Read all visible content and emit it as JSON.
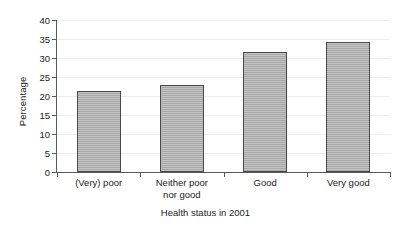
{
  "chart_data": {
    "type": "bar",
    "title": "",
    "xlabel": "Health status in 2001",
    "ylabel": "Percentage",
    "categories": [
      "(Very) poor",
      "Neither poor nor good",
      "Good",
      "Very good"
    ],
    "category_lines": [
      [
        "(Very) poor"
      ],
      [
        "Neither poor",
        "nor good"
      ],
      [
        "Good"
      ],
      [
        "Very good"
      ]
    ],
    "values": [
      21.4,
      22.8,
      31.7,
      34.2
    ],
    "ylim": [
      0,
      40
    ],
    "ytick_values": [
      0,
      5,
      10,
      15,
      20,
      25,
      30,
      35,
      40
    ],
    "ytick_labels": [
      "0",
      "5",
      "10",
      "15",
      "20",
      "25",
      "30",
      "35",
      "40"
    ],
    "grid": true,
    "legend": false,
    "bar_color": "#a9a9a9",
    "bar_edge_color": "#4a4a4a",
    "axis_color": "#5a5a5a",
    "grid_color": "#ededed",
    "text_color": "#222222"
  }
}
